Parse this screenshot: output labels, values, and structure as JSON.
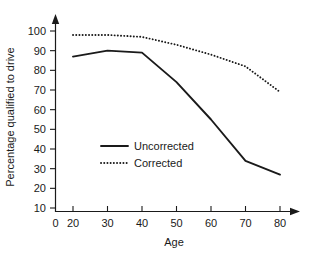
{
  "chart_data": {
    "type": "line",
    "title": "",
    "xlabel": "Age",
    "ylabel": "Percentage qualified to drive",
    "x": [
      20,
      30,
      40,
      50,
      60,
      70,
      80
    ],
    "xlim": [
      0,
      85
    ],
    "ylim": [
      0,
      104
    ],
    "xticks": [
      0,
      20,
      30,
      40,
      50,
      60,
      70,
      80
    ],
    "xtick_labels": [
      "0",
      "20",
      "30",
      "40",
      "50",
      "60",
      "70",
      "80"
    ],
    "yticks": [
      10,
      20,
      30,
      40,
      50,
      60,
      70,
      80,
      90,
      100
    ],
    "ytick_labels": [
      "10",
      "20",
      "30",
      "40",
      "50",
      "60",
      "70",
      "80",
      "90",
      "100"
    ],
    "grid": false,
    "legend_position": "center-left-inside",
    "axis_arrows": true,
    "series": [
      {
        "name": "Uncorrected",
        "style": "solid",
        "color": "#1a1a1a",
        "values": [
          87,
          90,
          89,
          74,
          55,
          34,
          27
        ]
      },
      {
        "name": "Corrected",
        "style": "dotted",
        "color": "#1a1a1a",
        "values": [
          98,
          98,
          97,
          93,
          88,
          82,
          69
        ]
      }
    ]
  },
  "legend": {
    "items": [
      {
        "label": "Uncorrected",
        "style": "solid"
      },
      {
        "label": "Corrected",
        "style": "dotted"
      }
    ]
  }
}
